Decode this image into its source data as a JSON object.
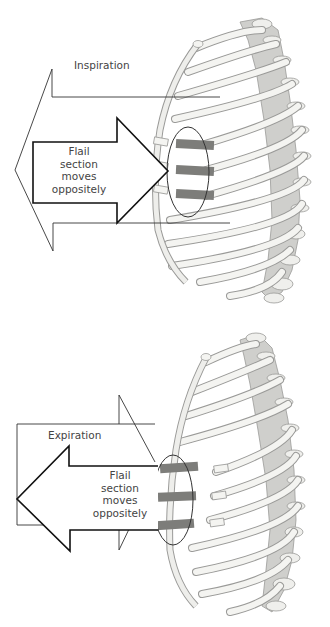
{
  "figure": {
    "panels": [
      {
        "id": "inspiration",
        "phase_label": "Inspiration",
        "flail_label_lines": [
          "Flail",
          "section",
          "moves",
          "oppositely"
        ],
        "chest_arrow_direction": "outward-left",
        "flail_arrow_direction": "inward-right"
      },
      {
        "id": "expiration",
        "phase_label": "Expiration",
        "flail_label_lines": [
          "Flail",
          "section",
          "moves",
          "oppositely"
        ],
        "chest_arrow_direction": "inward-right",
        "flail_arrow_direction": "outward-left"
      }
    ],
    "colors": {
      "bone": "#f2f2ef",
      "bone_outline": "#9a9a98",
      "fractured_segment": "#7d7d7a",
      "cartilage": "#c9c9c6",
      "arrow_stroke": "#222222",
      "text": "#444444"
    }
  }
}
